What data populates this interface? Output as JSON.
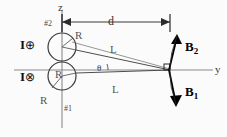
{
  "figure": {
    "axes": {
      "vertical_label": "z",
      "horizontal_label": "y"
    },
    "coils": [
      {
        "id": "coil-2",
        "marker_label": "#2",
        "radius_label": "R",
        "current_label": "I",
        "current_symbol": "⊕",
        "current_direction": "out-of-page",
        "center_x": 62,
        "center_y": 47,
        "radius": 14
      },
      {
        "id": "coil-1",
        "marker_label": "#1",
        "radius_label": "R",
        "radius_label_outer": "R",
        "current_label": "I",
        "current_symbol": "⊗",
        "current_direction": "into-page",
        "center_x": 62,
        "center_y": 76,
        "radius": 14
      }
    ],
    "dimension": {
      "label": "d",
      "start_x": 62,
      "end_x": 170,
      "y": 22
    },
    "slant_lines": [
      {
        "label": "L",
        "from": "coil-2-edge",
        "to": "field-point"
      },
      {
        "label": "L",
        "from": "coil-1-edge",
        "to": "field-point"
      }
    ],
    "angle": {
      "label": "θ",
      "vertex_x": 170,
      "vertex_y": 70
    },
    "field_point": {
      "x": 170,
      "y": 70,
      "right_angle_marker": true
    },
    "field_vectors": [
      {
        "label": "B",
        "subscript": "2",
        "direction": "up",
        "id": "B2"
      },
      {
        "label": "B",
        "subscript": "1",
        "direction": "down",
        "id": "B1"
      }
    ],
    "colors": {
      "stroke": "#2b2b2b",
      "light_stroke": "#7a7a7a",
      "axis": "#6e6e6e",
      "text": "#111111",
      "background": "#fbfbfb"
    }
  }
}
